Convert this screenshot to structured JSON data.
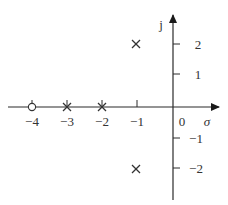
{
  "diagram": {
    "type": "pole-zero-plot",
    "axes": {
      "real_axis_label": "σ",
      "imag_axis_label": "j",
      "origin_label": "0",
      "real_ticks": [
        {
          "value": -4,
          "label": "−4"
        },
        {
          "value": -3,
          "label": "−3"
        },
        {
          "value": -2,
          "label": "−2"
        },
        {
          "value": -1,
          "label": "−1"
        }
      ],
      "imag_ticks": [
        {
          "value": 2,
          "label": "2"
        },
        {
          "value": 1,
          "label": "1"
        },
        {
          "value": -1,
          "label": "−1"
        },
        {
          "value": -2,
          "label": "−2"
        }
      ]
    },
    "poles": [
      {
        "re": -3,
        "im": 0,
        "marker": "×"
      },
      {
        "re": -2,
        "im": 0,
        "marker": "×"
      },
      {
        "re": -1,
        "im": 2,
        "marker": "×"
      },
      {
        "re": -1,
        "im": -2,
        "marker": "×"
      }
    ],
    "zeros": [
      {
        "re": -4,
        "im": 0,
        "marker": "○"
      }
    ]
  }
}
